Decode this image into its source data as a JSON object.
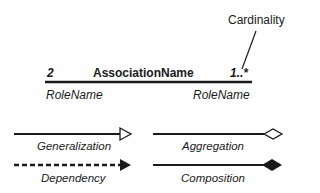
{
  "association": {
    "multiplicity_left": "2",
    "name": "AssociationName",
    "multiplicity_right": "1..*",
    "role_left": "RoleName",
    "role_right": "RoleName",
    "callout": "Cardinality"
  },
  "relationships": [
    {
      "label": "Generalization",
      "line": "solid",
      "end": "hollow-triangle"
    },
    {
      "label": "Aggregation",
      "line": "solid",
      "end": "hollow-diamond"
    },
    {
      "label": "Dependency",
      "line": "dashed",
      "end": "filled-triangle"
    },
    {
      "label": "Composition",
      "line": "solid",
      "end": "filled-diamond"
    }
  ],
  "colors": {
    "stroke": "#1a1a1a",
    "background": "#ffffff"
  }
}
